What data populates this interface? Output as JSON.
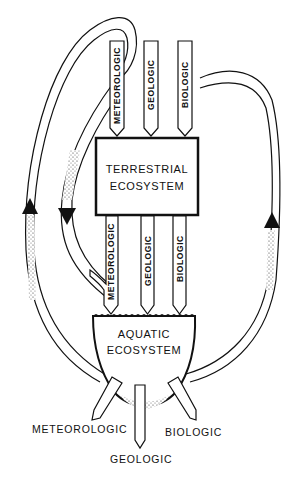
{
  "diagram": {
    "nodes": {
      "terrestrial": {
        "line1": "TERRESTRIAL",
        "line2": "ECOSYSTEM"
      },
      "aquatic": {
        "line1": "AQUATIC",
        "line2": "ECOSYSTEM"
      }
    },
    "inputs_to_terrestrial": [
      "METEOROLOGIC",
      "GEOLOGIC",
      "BIOLOGIC"
    ],
    "terrestrial_to_aquatic": [
      "METEOROLOGIC",
      "GEOLOGIC",
      "BIOLOGIC"
    ],
    "outputs_from_aquatic": [
      "METEOROLOGIC",
      "GEOLOGIC",
      "BIOLOGIC"
    ],
    "loops": [
      {
        "name": "meteorologic-recycle-left",
        "from": "aquatic meteorologic output",
        "to": "meteorologic input",
        "direction": "up"
      },
      {
        "name": "meteorologic-terrestrial-loop",
        "from": "meteorologic input",
        "to": "aquatic meteorologic input",
        "direction": "down"
      },
      {
        "name": "biologic-recycle-right",
        "from": "aquatic biologic output",
        "to": "biologic input",
        "direction": "up"
      }
    ],
    "colors": {
      "line": "#111111",
      "background": "#ffffff"
    }
  }
}
